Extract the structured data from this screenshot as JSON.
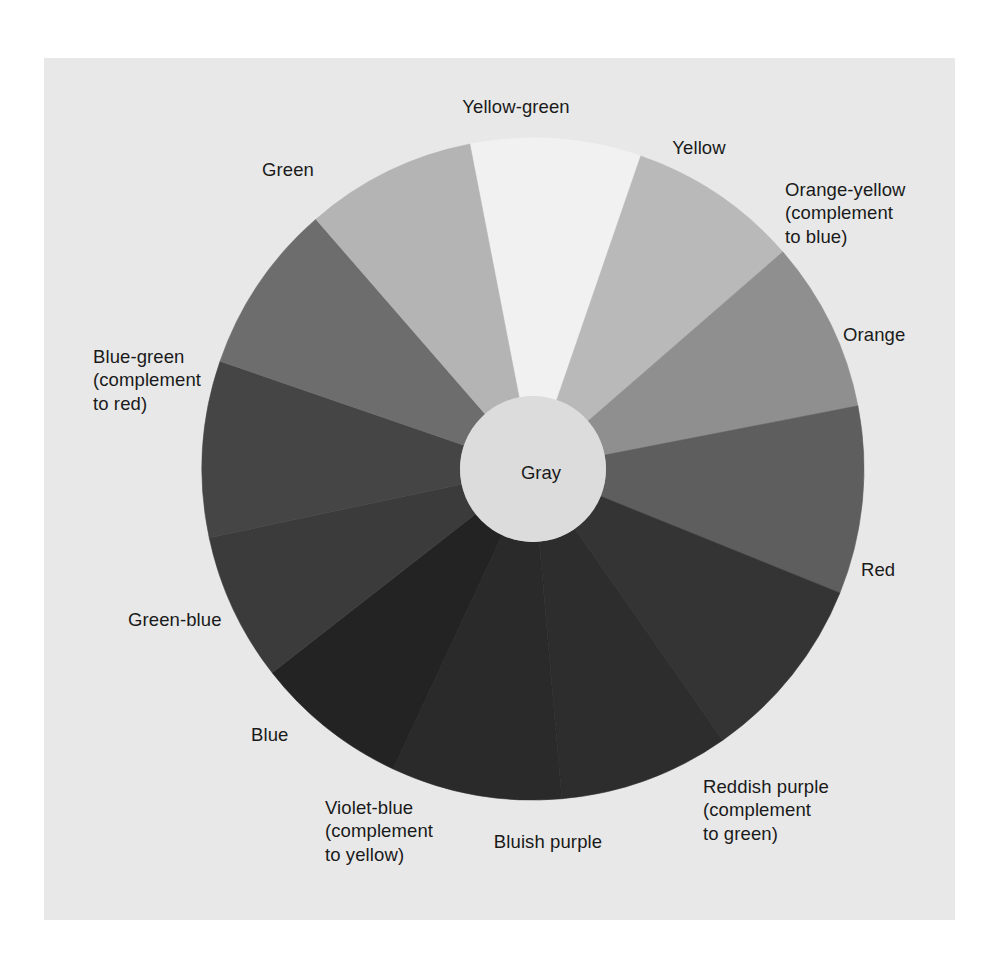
{
  "figure": {
    "kind": "color-wheel-diagram",
    "panel_background": "#e8e8e8",
    "page_background": "#ffffff",
    "text_color": "#1a1a1a"
  },
  "hub": {
    "label": "Gray",
    "fill": "#dcdcdc"
  },
  "chart_data": {
    "type": "pie",
    "title": "",
    "note": "Grayscale reproduction of a 12-hue color wheel; each wedge is an equal 30 degree sector. Fill values are the printed gray levels.",
    "center": {
      "x": 533,
      "y": 469
    },
    "outer_radius": 331,
    "inner_radius": 73,
    "legend": "none",
    "grid": false,
    "categories": [
      "Yellow",
      "Orange-yellow (complement to blue)",
      "Orange",
      "Red",
      "Reddish purple (complement to green)",
      "Bluish purple",
      "Violet-blue (complement to yellow)",
      "Blue",
      "Green-blue",
      "Blue-green (complement to red)",
      "Green",
      "Yellow-green"
    ],
    "values": [
      30,
      30,
      30,
      30,
      30,
      30,
      30,
      30,
      30,
      30,
      30,
      30
    ],
    "wedges": [
      {
        "name": "Yellow",
        "start_deg": -11,
        "end_deg": 19,
        "fill": "#f1f1f1"
      },
      {
        "name": "Orange-yellow",
        "start_deg": 19,
        "end_deg": 49,
        "fill": "#b9b9b9"
      },
      {
        "name": "Orange",
        "start_deg": 49,
        "end_deg": 79,
        "fill": "#8f8f8f"
      },
      {
        "name": "Red",
        "start_deg": 79,
        "end_deg": 112,
        "fill": "#5e5e5e"
      },
      {
        "name": "Reddish purple",
        "start_deg": 112,
        "end_deg": 145,
        "fill": "#343434"
      },
      {
        "name": "Bluish purple",
        "start_deg": 145,
        "end_deg": 175,
        "fill": "#2d2d2d"
      },
      {
        "name": "Violet-blue",
        "start_deg": 175,
        "end_deg": 205,
        "fill": "#2a2a2a"
      },
      {
        "name": "Blue",
        "start_deg": 205,
        "end_deg": 232,
        "fill": "#232323"
      },
      {
        "name": "Green-blue",
        "start_deg": 232,
        "end_deg": 258,
        "fill": "#3b3b3b"
      },
      {
        "name": "Blue-green",
        "start_deg": 258,
        "end_deg": 289,
        "fill": "#454545"
      },
      {
        "name": "Green",
        "start_deg": 289,
        "end_deg": 319,
        "fill": "#6d6d6d"
      },
      {
        "name": "Yellow-green",
        "start_deg": 319,
        "end_deg": 349,
        "fill": "#b4b4b4"
      }
    ],
    "xlabel": "",
    "ylabel": ""
  },
  "labels": [
    {
      "id": "yellow-green",
      "text": "Yellow-green",
      "x": 516,
      "y": 95,
      "align": "c"
    },
    {
      "id": "yellow",
      "text": "Yellow",
      "x": 699,
      "y": 136,
      "align": "c"
    },
    {
      "id": "orange-yellow",
      "text": "Orange-yellow\n(complement\nto blue)",
      "x": 785,
      "y": 178,
      "align": "l"
    },
    {
      "id": "orange",
      "text": "Orange",
      "x": 843,
      "y": 323,
      "align": "l"
    },
    {
      "id": "red",
      "text": "Red",
      "x": 861,
      "y": 558,
      "align": "l"
    },
    {
      "id": "reddish-purple",
      "text": "Reddish purple\n(complement\nto green)",
      "x": 703,
      "y": 775,
      "align": "l"
    },
    {
      "id": "bluish-purple",
      "text": "Bluish purple",
      "x": 548,
      "y": 830,
      "align": "c"
    },
    {
      "id": "violet-blue",
      "text": "Violet-blue\n(complement\nto yellow)",
      "x": 325,
      "y": 796,
      "align": "l"
    },
    {
      "id": "blue",
      "text": "Blue",
      "x": 251,
      "y": 723,
      "align": "l"
    },
    {
      "id": "green-blue",
      "text": "Green-blue",
      "x": 128,
      "y": 608,
      "align": "l"
    },
    {
      "id": "blue-green",
      "text": "Blue-green\n(complement\nto red)",
      "x": 93,
      "y": 345,
      "align": "l"
    },
    {
      "id": "green",
      "text": "Green",
      "x": 288,
      "y": 158,
      "align": "c"
    }
  ]
}
